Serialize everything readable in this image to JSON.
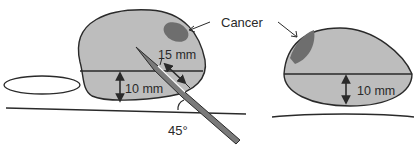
{
  "diagram": {
    "left_panel": {
      "depth_label": "15 mm",
      "thickness_label": "10 mm",
      "angle_label": "45°"
    },
    "right_panel": {
      "annotation_label": "Cancer",
      "thickness_label": "10 mm"
    },
    "colors": {
      "tissue_fill": "#bdbdbd",
      "cancer_fill": "#6e6e6e",
      "needle_fill": "#7a7a7a",
      "outline": "#2a2a2a"
    }
  }
}
